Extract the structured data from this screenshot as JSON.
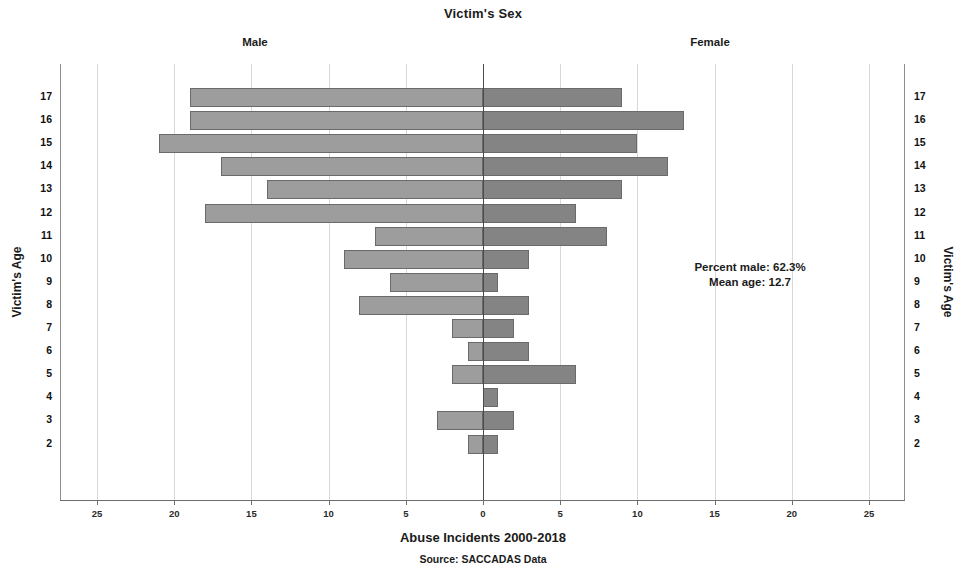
{
  "chart_data": {
    "type": "bar",
    "subtype": "population-pyramid",
    "title": "Victim's Sex",
    "xlabel": "Abuse Incidents 2000-2018",
    "ylabel": "Victim's Age",
    "ylabel_right": "Victim's Age",
    "source": "Source: SACCADAS Data",
    "left_header": "Male",
    "right_header": "Female",
    "grid": true,
    "legend_position": "top (headers Male / Female)",
    "xlim": [
      -27.5,
      27.5
    ],
    "xticks": [
      25,
      20,
      15,
      10,
      5,
      0,
      5,
      10,
      15,
      20,
      25
    ],
    "xtick_values": [
      -25,
      -20,
      -15,
      -10,
      -5,
      0,
      5,
      10,
      15,
      20,
      25
    ],
    "categories": [
      17,
      16,
      15,
      14,
      13,
      12,
      11,
      10,
      9,
      8,
      7,
      6,
      5,
      4,
      3,
      2
    ],
    "series": [
      {
        "name": "Male",
        "color": "#9d9d9d",
        "values": [
          19,
          19,
          21,
          17,
          14,
          18,
          7,
          9,
          6,
          8,
          2,
          1,
          2,
          0,
          3,
          1
        ]
      },
      {
        "name": "Female",
        "color": "#848484",
        "values": [
          9,
          13,
          10,
          12,
          9,
          6,
          8,
          3,
          1,
          3,
          2,
          3,
          6,
          1,
          2,
          1
        ]
      }
    ],
    "annotations": [
      "Percent male: 62.3%",
      "Mean age: 12.7"
    ]
  },
  "stats": {
    "percent_male": "Percent male: 62.3%",
    "mean_age": "Mean age: 12.7"
  }
}
